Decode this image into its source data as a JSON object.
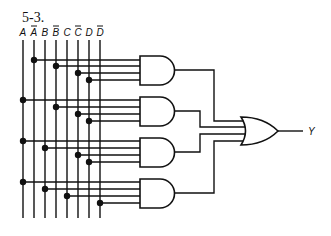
{
  "figure": {
    "label": "5-3.",
    "output_label": "Y"
  },
  "inputs": [
    {
      "name": "A",
      "complement": false,
      "x": 23
    },
    {
      "name": "A",
      "complement": true,
      "x": 34
    },
    {
      "name": "B",
      "complement": false,
      "x": 45
    },
    {
      "name": "B",
      "complement": true,
      "x": 56
    },
    {
      "name": "C",
      "complement": false,
      "x": 67
    },
    {
      "name": "C",
      "complement": true,
      "x": 78
    },
    {
      "name": "D",
      "complement": false,
      "x": 89
    },
    {
      "name": "D",
      "complement": true,
      "x": 100
    }
  ],
  "and_gates": [
    {
      "id": "and1",
      "inputs": [
        "A'",
        "B'",
        "C'",
        "D"
      ],
      "top": 56,
      "input_ys": [
        60,
        66,
        73,
        80
      ],
      "taps": [
        1,
        3,
        5,
        6
      ]
    },
    {
      "id": "and2",
      "inputs": [
        "A",
        "B'",
        "C'",
        "D"
      ],
      "top": 97,
      "input_ys": [
        100,
        107,
        114,
        121
      ],
      "taps": [
        0,
        3,
        5,
        6
      ]
    },
    {
      "id": "and3",
      "inputs": [
        "A",
        "B",
        "C'",
        "D"
      ],
      "top": 138,
      "input_ys": [
        141,
        148,
        155,
        162
      ],
      "taps": [
        0,
        2,
        5,
        6
      ]
    },
    {
      "id": "and4",
      "inputs": [
        "A",
        "B",
        "C",
        "D'"
      ],
      "top": 179,
      "input_ys": [
        182,
        189,
        196,
        203
      ],
      "taps": [
        0,
        2,
        4,
        7
      ]
    }
  ],
  "or_gate": {
    "id": "or1",
    "inputs": 4,
    "output": "Y"
  },
  "expression": "Y = A'B'C'D + AB'C'D + ABC'D + ABCD'"
}
